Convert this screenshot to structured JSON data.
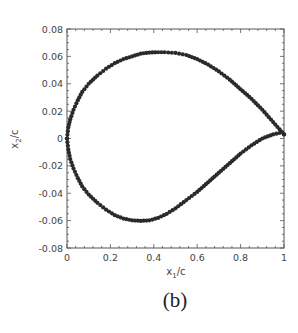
{
  "chart_data": {
    "type": "scatter",
    "title": "",
    "panel_label": "(b)",
    "xlabel": "x_1/c",
    "ylabel": "x_2/c",
    "xlim": [
      0,
      1
    ],
    "ylim": [
      -0.08,
      0.08
    ],
    "xticks": [
      0,
      0.2,
      0.4,
      0.6,
      0.8,
      1
    ],
    "xtick_labels": [
      "0",
      "0.2",
      "0.4",
      "0.6",
      "0.8",
      "1"
    ],
    "yticks": [
      0.08,
      0.06,
      0.04,
      0.02,
      0,
      -0.02,
      -0.04,
      -0.06,
      -0.08
    ],
    "ytick_labels": [
      "0.08",
      "0.06",
      "0.04",
      "0.02",
      "0",
      "-0.02",
      "-0.04",
      "-0.06",
      "-0.08"
    ],
    "grid": false,
    "legend": null,
    "marker_color": "#2a2a2a",
    "series": [
      {
        "name": "upper surface",
        "x": [
          1.0,
          0.95,
          0.9,
          0.85,
          0.8,
          0.75,
          0.7,
          0.65,
          0.6,
          0.55,
          0.5,
          0.45,
          0.42,
          0.38,
          0.34,
          0.3,
          0.26,
          0.22,
          0.18,
          0.14,
          0.1,
          0.07,
          0.05,
          0.03,
          0.015,
          0.006,
          0.0
        ],
        "y": [
          0.003,
          0.012,
          0.021,
          0.029,
          0.036,
          0.043,
          0.049,
          0.054,
          0.058,
          0.061,
          0.0625,
          0.063,
          0.063,
          0.0628,
          0.062,
          0.06,
          0.058,
          0.055,
          0.051,
          0.046,
          0.04,
          0.034,
          0.028,
          0.021,
          0.014,
          0.008,
          0.0
        ]
      },
      {
        "name": "lower surface",
        "x": [
          0.0,
          0.006,
          0.015,
          0.03,
          0.05,
          0.07,
          0.1,
          0.14,
          0.18,
          0.22,
          0.26,
          0.3,
          0.34,
          0.38,
          0.42,
          0.46,
          0.5,
          0.55,
          0.6,
          0.65,
          0.7,
          0.75,
          0.8,
          0.85,
          0.9,
          0.95,
          0.98,
          1.0
        ],
        "y": [
          0.0,
          -0.008,
          -0.015,
          -0.022,
          -0.029,
          -0.035,
          -0.041,
          -0.047,
          -0.052,
          -0.056,
          -0.0585,
          -0.0598,
          -0.0602,
          -0.0598,
          -0.058,
          -0.055,
          -0.051,
          -0.045,
          -0.039,
          -0.032,
          -0.025,
          -0.018,
          -0.011,
          -0.005,
          0.0,
          0.003,
          0.004,
          0.003
        ]
      }
    ]
  }
}
